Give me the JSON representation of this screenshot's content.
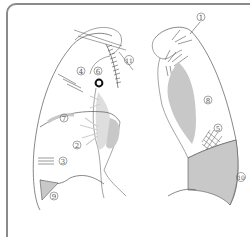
{
  "diagram": {
    "colors": {
      "frame": "#8a8a8a",
      "outline": "#555555",
      "shade": "#c8c8c8",
      "hilum_haze": "#d6d6d6",
      "marker": "#111111"
    },
    "labels": [
      {
        "id": "1",
        "text": "①",
        "view": "right-lateral",
        "x": 201,
        "y": 17
      },
      {
        "id": "2",
        "text": "②",
        "view": "left-frontal",
        "x": 77,
        "y": 145
      },
      {
        "id": "3",
        "text": "③",
        "view": "left-frontal",
        "x": 63,
        "y": 161
      },
      {
        "id": "4",
        "text": "④",
        "view": "left-frontal",
        "x": 81,
        "y": 71
      },
      {
        "id": "5",
        "text": "⑤",
        "view": "right-lateral",
        "x": 218,
        "y": 128
      },
      {
        "id": "6",
        "text": "⑥",
        "view": "left-frontal",
        "x": 98,
        "y": 71
      },
      {
        "id": "7",
        "text": "⑦",
        "view": "left-frontal",
        "x": 64,
        "y": 118
      },
      {
        "id": "8",
        "text": "⑧",
        "view": "right-lateral",
        "x": 208,
        "y": 100
      },
      {
        "id": "9",
        "text": "⑨",
        "view": "left-frontal",
        "x": 54,
        "y": 196
      },
      {
        "id": "10",
        "text": "⑩",
        "view": "right-lateral",
        "x": 241,
        "y": 177
      },
      {
        "id": "11",
        "text": "⑪",
        "view": "left-frontal",
        "x": 129,
        "y": 60
      }
    ]
  }
}
